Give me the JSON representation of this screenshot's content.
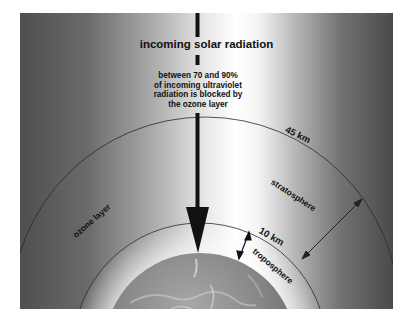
{
  "diagram": {
    "title": "incoming solar radiation",
    "note_lines": [
      "between 70 and 90%",
      "of incoming ultraviolet",
      "radiation is blocked by",
      "the ozone layer"
    ],
    "labels": {
      "altitude_upper": "45 km",
      "altitude_lower": "10 km",
      "ozone": "ozone layer",
      "stratosphere": "stratosphere",
      "troposphere": "troposphere"
    },
    "colors": {
      "line": "#222222",
      "arrow": "#111111",
      "text": "#111111"
    }
  }
}
